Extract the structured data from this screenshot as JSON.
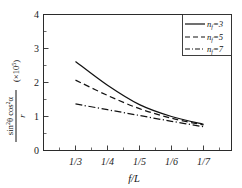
{
  "chart_data": {
    "type": "line",
    "title": "",
    "subtitle": "",
    "xlabel": "f/L",
    "ylabel": "sin²θ cos²α / r  (×10⁵)",
    "ylabel_numerator": "sin²θ cos²α",
    "ylabel_denominator": "r",
    "ylabel_multiplier": "(×10⁵)",
    "x_tick_labels": [
      "1/3",
      "1/4",
      "1/5",
      "1/6",
      "1/7"
    ],
    "x_tick_values": [
      0.3333,
      0.25,
      0.2,
      0.1667,
      0.1429
    ],
    "y_tick_labels": [
      "0",
      "1",
      "2",
      "3",
      "4"
    ],
    "y_tick_values": [
      0,
      1,
      2,
      3,
      4
    ],
    "ylim": [
      0,
      4
    ],
    "xlim_labels": [
      "left-of-1/3",
      "right-of-1/7"
    ],
    "grid": false,
    "legend_position": "top-right",
    "axis_minor_ticks": true,
    "series": [
      {
        "name": "n_f=3",
        "label": "n",
        "subscript": "f",
        "value_text": "=3",
        "linestyle": "solid",
        "color": "#121212",
        "x": [
          "1/3",
          "1/4",
          "1/5",
          "1/6",
          "1/7"
        ],
        "values": [
          2.62,
          1.92,
          1.35,
          1.0,
          0.77
        ]
      },
      {
        "name": "n_f=5",
        "label": "n",
        "subscript": "f",
        "value_text": "=5",
        "linestyle": "dashed",
        "color": "#121212",
        "x": [
          "1/3",
          "1/4",
          "1/5",
          "1/6",
          "1/7"
        ],
        "values": [
          2.07,
          1.62,
          1.23,
          0.95,
          0.75
        ]
      },
      {
        "name": "n_f=7",
        "label": "n",
        "subscript": "f",
        "value_text": "=7",
        "linestyle": "dashdot",
        "color": "#121212",
        "x": [
          "1/3",
          "1/4",
          "1/5",
          "1/6",
          "1/7"
        ],
        "values": [
          1.37,
          1.2,
          1.03,
          0.86,
          0.7
        ]
      }
    ]
  },
  "legend": {
    "entries": [
      {
        "symbol": "n",
        "sub": "f",
        "val": "=3"
      },
      {
        "symbol": "n",
        "sub": "f",
        "val": "=5"
      },
      {
        "symbol": "n",
        "sub": "f",
        "val": "=7"
      }
    ]
  },
  "axes": {
    "y_ticks": [
      "0",
      "1",
      "2",
      "3",
      "4"
    ],
    "x_ticks": [
      "1/3",
      "1/4",
      "1/5",
      "1/6",
      "1/7"
    ],
    "x_title": "f/L",
    "y_numerator": "sin",
    "y_num_exp1": "2",
    "y_num_theta": "θ cos",
    "y_num_exp2": "2",
    "y_num_alpha": "α",
    "y_denominator": "r",
    "y_scale_open": "(×10",
    "y_scale_exp": "5",
    "y_scale_close": ")"
  }
}
